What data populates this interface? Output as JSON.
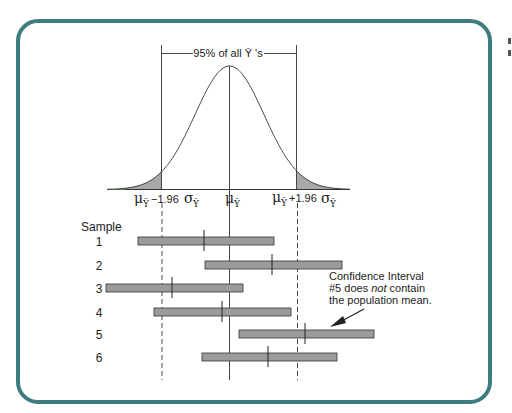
{
  "figure": {
    "border_color": "#3f7c80",
    "bracket_label": "95% of all Ȳ 's",
    "axis_labels": {
      "left": {
        "mu": "μ",
        "sub": "Ȳ",
        "rest": "−1.96",
        "sigma": "σ",
        "sigma_sub": "Ȳ"
      },
      "center": {
        "mu": "μ",
        "sub": "Ȳ"
      },
      "right": {
        "mu": "μ",
        "sub": "Ȳ",
        "rest": "+1.96",
        "sigma": "σ",
        "sigma_sub": "Ȳ"
      }
    },
    "sample_heading": "Sample",
    "annotation": {
      "line1": "Confidence Interval",
      "line2_pre": "#5 does ",
      "line2_em": "not",
      "line2_post": " contain",
      "line3": "the population mean."
    },
    "bar_color": "#9b9b9b"
  },
  "chart_data": {
    "type": "interval",
    "distribution": "normal",
    "critical_values": [
      "μȲ − 1.96 σȲ",
      "μȲ",
      "μȲ + 1.96 σȲ"
    ],
    "shaded_tails": true,
    "samples": [
      {
        "label": "1",
        "lower": 138,
        "upper": 274,
        "mean": 204,
        "contains_mu": true
      },
      {
        "label": "2",
        "lower": 205,
        "upper": 342,
        "mean": 272,
        "contains_mu": true
      },
      {
        "label": "3",
        "lower": 106,
        "upper": 243,
        "mean": 172,
        "contains_mu": true
      },
      {
        "label": "4",
        "lower": 154,
        "upper": 291,
        "mean": 222,
        "contains_mu": true
      },
      {
        "label": "5",
        "lower": 239,
        "upper": 374,
        "mean": 305,
        "contains_mu": false
      },
      {
        "label": "6",
        "lower": 202,
        "upper": 337,
        "mean": 268,
        "contains_mu": true
      }
    ],
    "pixel_reference": {
      "mu_x": 230,
      "minus_1_96_x": 162,
      "plus_1_96_x": 297
    },
    "annotation": "Confidence Interval #5 does not contain the population mean."
  }
}
